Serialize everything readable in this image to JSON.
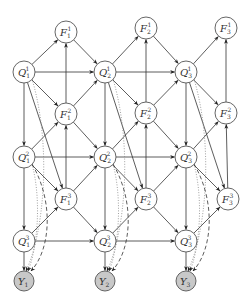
{
  "diagram": {
    "nodes": [
      {
        "id": "F1_1",
        "base": "F",
        "sub": "1",
        "sup": "1",
        "x": 66,
        "y": 32,
        "observed": false
      },
      {
        "id": "F2_1",
        "base": "F",
        "sub": "2",
        "sup": "1",
        "x": 146,
        "y": 28,
        "observed": false
      },
      {
        "id": "F3_1",
        "base": "F",
        "sub": "3",
        "sup": "1",
        "x": 226,
        "y": 28,
        "observed": false
      },
      {
        "id": "Q1_1",
        "base": "Q",
        "sub": "1",
        "sup": "1",
        "x": 24,
        "y": 72,
        "observed": false
      },
      {
        "id": "Q2_1",
        "base": "Q",
        "sub": "2",
        "sup": "1",
        "x": 105,
        "y": 72,
        "observed": false
      },
      {
        "id": "Q3_1",
        "base": "Q",
        "sub": "3",
        "sup": "1",
        "x": 186,
        "y": 72,
        "observed": false
      },
      {
        "id": "F1_2",
        "base": "F",
        "sub": "1",
        "sup": "2",
        "x": 66,
        "y": 114,
        "observed": false
      },
      {
        "id": "F2_2",
        "base": "F",
        "sub": "2",
        "sup": "2",
        "x": 146,
        "y": 113,
        "observed": false
      },
      {
        "id": "F3_2",
        "base": "F",
        "sub": "3",
        "sup": "2",
        "x": 226,
        "y": 113,
        "observed": false
      },
      {
        "id": "Q1_2",
        "base": "Q",
        "sub": "1",
        "sup": "2",
        "x": 24,
        "y": 157,
        "observed": false
      },
      {
        "id": "Q2_2",
        "base": "Q",
        "sub": "2",
        "sup": "2",
        "x": 105,
        "y": 157,
        "observed": false
      },
      {
        "id": "Q3_2",
        "base": "Q",
        "sub": "3",
        "sup": "2",
        "x": 186,
        "y": 157,
        "observed": false
      },
      {
        "id": "F1_3",
        "base": "F",
        "sub": "1",
        "sup": "3",
        "x": 66,
        "y": 199,
        "observed": false
      },
      {
        "id": "F2_3",
        "base": "F",
        "sub": "2",
        "sup": "3",
        "x": 146,
        "y": 199,
        "observed": false
      },
      {
        "id": "F3_3",
        "base": "F",
        "sub": "3",
        "sup": "3",
        "x": 228,
        "y": 199,
        "observed": false
      },
      {
        "id": "Q1_3",
        "base": "Q",
        "sub": "1",
        "sup": "3",
        "x": 24,
        "y": 241,
        "observed": false
      },
      {
        "id": "Q2_3",
        "base": "Q",
        "sub": "2",
        "sup": "3",
        "x": 105,
        "y": 241,
        "observed": false
      },
      {
        "id": "Q3_3",
        "base": "Q",
        "sub": "3",
        "sup": "3",
        "x": 186,
        "y": 241,
        "observed": false
      },
      {
        "id": "Y1",
        "base": "Y",
        "sub": "1",
        "sup": "",
        "x": 24,
        "y": 281,
        "observed": true
      },
      {
        "id": "Y2",
        "base": "Y",
        "sub": "2",
        "sup": "",
        "x": 105,
        "y": 281,
        "observed": true
      },
      {
        "id": "Y3",
        "base": "Y",
        "sub": "3",
        "sup": "",
        "x": 186,
        "y": 281,
        "observed": true
      }
    ],
    "edges_solid": [
      [
        "Q1_1",
        "F1_1"
      ],
      [
        "F1_1",
        "Q2_1"
      ],
      [
        "Q1_1",
        "Q2_1"
      ],
      [
        "Q1_1",
        "F1_2"
      ],
      [
        "F1_2",
        "Q2_1"
      ],
      [
        "F1_2",
        "F1_1"
      ],
      [
        "Q2_1",
        "F2_1"
      ],
      [
        "F2_1",
        "Q3_1"
      ],
      [
        "Q2_1",
        "Q3_1"
      ],
      [
        "Q2_1",
        "F2_2"
      ],
      [
        "F2_2",
        "Q3_1"
      ],
      [
        "F2_2",
        "F2_1"
      ],
      [
        "Q3_1",
        "F3_1"
      ],
      [
        "Q3_1",
        "F3_2"
      ],
      [
        "F3_2",
        "F3_1"
      ],
      [
        "Q1_1",
        "Q1_2"
      ],
      [
        "Q2_1",
        "Q2_2"
      ],
      [
        "Q3_1",
        "Q3_2"
      ],
      [
        "Q1_1",
        "F1_3"
      ],
      [
        "Q2_1",
        "F2_3"
      ],
      [
        "Q3_1",
        "F3_3"
      ],
      [
        "Q1_2",
        "F1_2"
      ],
      [
        "F1_2",
        "Q2_2"
      ],
      [
        "Q1_2",
        "Q2_2"
      ],
      [
        "Q1_2",
        "F1_3"
      ],
      [
        "F1_3",
        "Q2_2"
      ],
      [
        "F1_3",
        "F1_2"
      ],
      [
        "Q2_2",
        "F2_2"
      ],
      [
        "F2_2",
        "Q3_2"
      ],
      [
        "Q2_2",
        "Q3_2"
      ],
      [
        "Q2_2",
        "F2_3"
      ],
      [
        "F2_3",
        "Q3_2"
      ],
      [
        "F2_3",
        "F2_2"
      ],
      [
        "Q3_2",
        "F3_2"
      ],
      [
        "Q3_2",
        "F3_3"
      ],
      [
        "F3_3",
        "F3_2"
      ],
      [
        "Q1_2",
        "Q1_3"
      ],
      [
        "Q2_2",
        "Q2_3"
      ],
      [
        "Q3_2",
        "Q3_3"
      ],
      [
        "Q1_3",
        "F1_3"
      ],
      [
        "F1_3",
        "Q2_3"
      ],
      [
        "Q1_3",
        "Q2_3"
      ],
      [
        "Q2_3",
        "F2_3"
      ],
      [
        "F2_3",
        "Q3_3"
      ],
      [
        "Q2_3",
        "Q3_3"
      ],
      [
        "Q3_3",
        "F3_3"
      ],
      [
        "Q1_3",
        "Y1"
      ],
      [
        "Q2_3",
        "Y2"
      ],
      [
        "Q3_3",
        "Y3"
      ]
    ],
    "edges_dotted": [
      [
        "Q1_1",
        "Y1"
      ],
      [
        "Q2_1",
        "Y2"
      ],
      [
        "Q3_1",
        "Y3"
      ],
      [
        "Q1_2",
        "Y1"
      ],
      [
        "Q2_2",
        "Y2"
      ],
      [
        "Q3_2",
        "Y3"
      ]
    ],
    "edges_dashed": [
      [
        "Q1_2",
        "Y1"
      ],
      [
        "Q2_2",
        "Y2"
      ],
      [
        "Q3_2",
        "Y3"
      ]
    ]
  }
}
